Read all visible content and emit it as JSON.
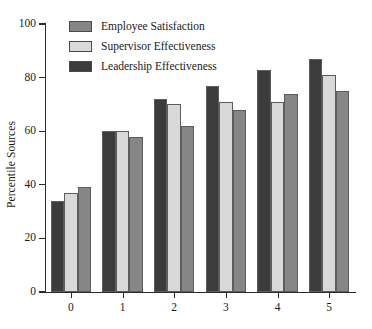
{
  "chart_data": {
    "type": "bar",
    "title": "",
    "subtitle": "",
    "xlabel": "",
    "ylabel": "Percentile Sources",
    "categories": [
      "0",
      "1",
      "2",
      "3",
      "4",
      "5"
    ],
    "ylim": [
      0,
      100
    ],
    "yticks": [
      0,
      20,
      40,
      60,
      80,
      100
    ],
    "ytick_labels": [
      "0",
      "20",
      "40",
      "60",
      "80",
      "100"
    ],
    "grid": false,
    "legend_position": "top-left-inside",
    "bar_draw_order": [
      "Leadership Effectiveness",
      "Supervisor Effectiveness",
      "Employee Satisfaction"
    ],
    "series": [
      {
        "name": "Employee Satisfaction",
        "color": "#868686",
        "values": [
          39,
          58,
          62,
          68,
          74,
          75
        ]
      },
      {
        "name": "Supervisor Effectiveness",
        "color": "#d9d9d9",
        "values": [
          37,
          60,
          70,
          71,
          71,
          81
        ]
      },
      {
        "name": "Leadership Effectiveness",
        "color": "#3c3c3c",
        "values": [
          34,
          60,
          72,
          77,
          83,
          87
        ]
      }
    ]
  },
  "axes": {
    "y_title": "Percentile Sources"
  },
  "legend": {
    "entries": [
      {
        "label": "Employee Satisfaction",
        "swatch_color": "#868686"
      },
      {
        "label": "Supervisor Effectiveness",
        "swatch_color": "#d9d9d9"
      },
      {
        "label": "Leadership Effectiveness",
        "swatch_color": "#3c3c3c"
      }
    ]
  },
  "colors": {
    "axis": "#2b2b2b",
    "text": "#1a1a1a",
    "background": "#ffffff",
    "bar_outline": "#5d5d5d"
  }
}
